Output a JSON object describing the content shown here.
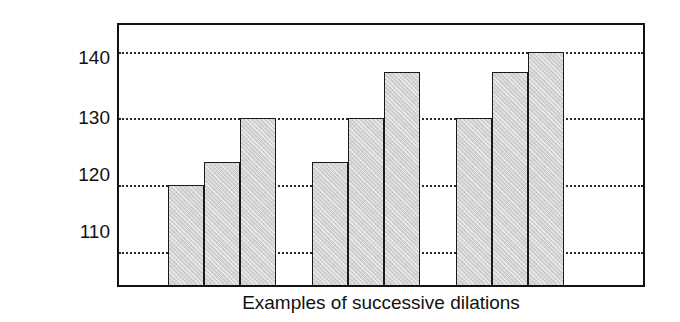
{
  "chart_data": {
    "type": "bar",
    "title": "",
    "subtitle": "",
    "xlabel": "Examples of successive dilations",
    "ylabel": "Volume (mL)",
    "ylim": [
      105,
      144
    ],
    "yticks": [
      110,
      120,
      130,
      140
    ],
    "ytick_labels": [
      "110",
      "120",
      "130",
      "140"
    ],
    "grid": true,
    "grid_axis": "y",
    "grid_style": "dotted",
    "legend": false,
    "legend_position": "none",
    "categories": [
      "1",
      "2",
      "3",
      "4",
      "5",
      "6",
      "7",
      "8",
      "9"
    ],
    "values": [
      120,
      123.5,
      130,
      123.5,
      130,
      137,
      130,
      137,
      140
    ],
    "groups": [
      {
        "name": "Example 1",
        "values": [
          120,
          123.5,
          130
        ]
      },
      {
        "name": "Example 2",
        "values": [
          123.5,
          130,
          137
        ]
      },
      {
        "name": "Example 3",
        "values": [
          130,
          137,
          140
        ]
      }
    ],
    "bar_color": "#d2d2d2",
    "bar_edge_color": "#1a1a1a",
    "axis_color": "#121212",
    "background_color": "#ffffff"
  },
  "axis": {
    "y_title": "Volume (mL)",
    "x_title": "Examples of successive dilations",
    "tick_140": "140",
    "tick_130": "130",
    "tick_120": "120",
    "tick_110": "110"
  }
}
